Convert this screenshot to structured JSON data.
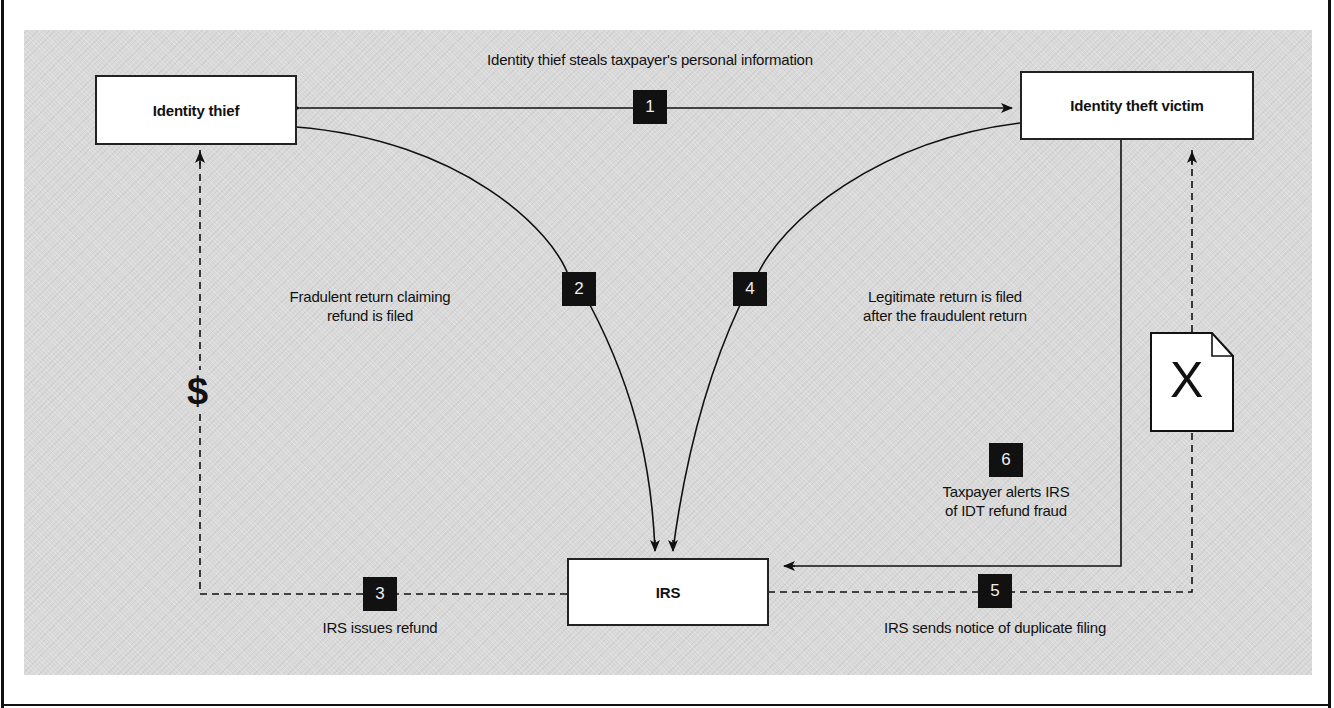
{
  "diagram": {
    "title_cutoff": "",
    "nodes": {
      "identity_thief": "Identity thief",
      "victim": "Identity theft victim",
      "irs": "IRS"
    },
    "steps": [
      {
        "number": "1",
        "label": "Identity thief steals taxpayer's personal information"
      },
      {
        "number": "2",
        "label_line1": "Fradulent return claiming",
        "label_line2": "refund is filed"
      },
      {
        "number": "3",
        "label": "IRS issues refund"
      },
      {
        "number": "4",
        "label_line1": "Legitimate return is filed",
        "label_line2": "after the fraudulent return"
      },
      {
        "number": "5",
        "label": "IRS sends notice of duplicate filing"
      },
      {
        "number": "6",
        "label_line1": "Taxpayer alerts IRS",
        "label_line2": "of IDT refund fraud"
      }
    ],
    "icons": {
      "money": "$",
      "rejected_document": "X"
    },
    "colors": {
      "background_panel": "#d9d9d9",
      "box_fill": "#ffffff",
      "badge_fill": "#111111",
      "line": "#111111"
    }
  }
}
